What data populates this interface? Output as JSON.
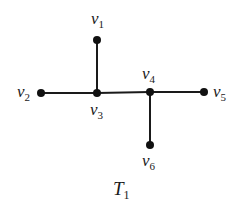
{
  "diagram": {
    "type": "tree",
    "caption": {
      "main": "T",
      "sub": "1",
      "x": 113,
      "y": 195
    },
    "nodes": [
      {
        "id": "v1",
        "label": "v",
        "sub": "1",
        "x": 97,
        "y": 40,
        "lx": 91,
        "ly": 24
      },
      {
        "id": "v2",
        "label": "v",
        "sub": "2",
        "x": 41,
        "y": 93,
        "lx": 17,
        "ly": 97
      },
      {
        "id": "v3",
        "label": "v",
        "sub": "3",
        "x": 97,
        "y": 93,
        "lx": 90,
        "ly": 115
      },
      {
        "id": "v4",
        "label": "v",
        "sub": "4",
        "x": 150,
        "y": 92,
        "lx": 142,
        "ly": 79
      },
      {
        "id": "v5",
        "label": "v",
        "sub": "5",
        "x": 204,
        "y": 92,
        "lx": 213,
        "ly": 97
      },
      {
        "id": "v6",
        "label": "v",
        "sub": "6",
        "x": 150,
        "y": 145,
        "lx": 142,
        "ly": 166
      }
    ],
    "edges": [
      [
        "v1",
        "v3"
      ],
      [
        "v2",
        "v3"
      ],
      [
        "v3",
        "v4"
      ],
      [
        "v4",
        "v5"
      ],
      [
        "v4",
        "v6"
      ]
    ],
    "colors": {
      "stroke": "#1a1a1a",
      "node": "#111111",
      "background": "#ffffff"
    }
  }
}
